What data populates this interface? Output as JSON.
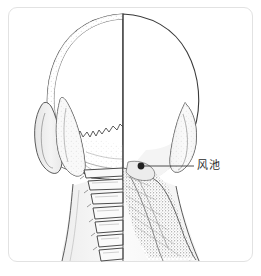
{
  "figure": {
    "kind": "anatomical-illustration",
    "view": "posterior-head-and-neck",
    "frame_color": "#e2e2e2",
    "background_color": "#ffffff",
    "line_color": "#3a3a3a",
    "shade_color": "#d8d8d8"
  },
  "annotations": {
    "acupoints": [
      {
        "label": "风池",
        "dot_color": "#222222",
        "dot_x": 141,
        "dot_y": 166,
        "leader_line_to_x": 194,
        "leader_line_to_y": 166
      }
    ]
  }
}
